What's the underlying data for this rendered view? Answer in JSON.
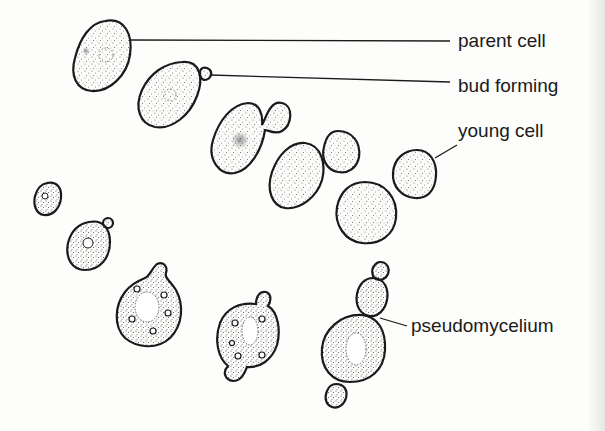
{
  "diagram": {
    "labels": [
      {
        "id": "parent",
        "text": "parent cell",
        "x": 458,
        "y": 31
      },
      {
        "id": "bud",
        "text": "bud forming",
        "x": 458,
        "y": 76
      },
      {
        "id": "young",
        "text": "young cell",
        "x": 458,
        "y": 121
      },
      {
        "id": "pseudo",
        "text": "pseudomycelium",
        "x": 411,
        "y": 316
      }
    ],
    "colors": {
      "outline": "#1a1a1a",
      "stipple": "#555555",
      "background": "#fdfdfc"
    }
  }
}
